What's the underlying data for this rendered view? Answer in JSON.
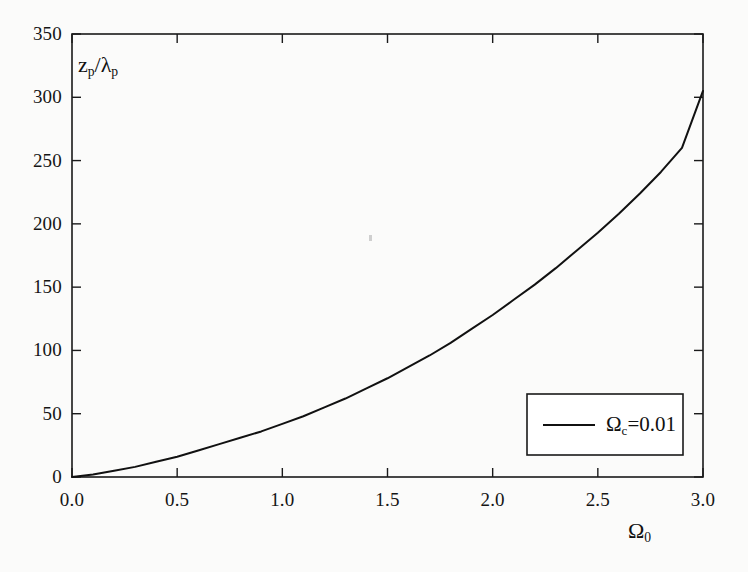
{
  "figure": {
    "background_color": "#fbfbfa",
    "line_color": "#111111",
    "frame_color": "#1a1a1a"
  },
  "axes": {
    "x_label": "Ω",
    "x_label_sub": "0",
    "y_label": "z",
    "y_label_sub": "p",
    "y_label_tail": "/λ",
    "y_label_tail_sub": "p"
  },
  "legend": {
    "entry_label": "Ω",
    "entry_label_sub": "c",
    "entry_label_tail": "=0.01"
  },
  "x_tick_labels": [
    "0.0",
    "0.5",
    "1.0",
    "1.5",
    "2.0",
    "2.5",
    "3.0"
  ],
  "y_tick_labels": [
    "0",
    "50",
    "100",
    "150",
    "200",
    "250",
    "300",
    "350"
  ],
  "chart_data": {
    "type": "line",
    "title": "",
    "xlabel": "Ω_0",
    "ylabel": "z_p/λ_p",
    "xlim": [
      0.0,
      3.0
    ],
    "ylim": [
      0,
      350
    ],
    "xticks": [
      0.0,
      0.5,
      1.0,
      1.5,
      2.0,
      2.5,
      3.0
    ],
    "yticks": [
      0,
      50,
      100,
      150,
      200,
      250,
      300,
      350
    ],
    "grid": false,
    "legend_position": "lower-right",
    "series": [
      {
        "name": "Ω_c=0.01",
        "color": "#111111",
        "x": [
          0.0,
          0.1,
          0.2,
          0.3,
          0.4,
          0.5,
          0.6,
          0.7,
          0.8,
          0.9,
          1.0,
          1.1,
          1.2,
          1.3,
          1.4,
          1.5,
          1.6,
          1.7,
          1.8,
          1.9,
          2.0,
          2.1,
          2.2,
          2.3,
          2.4,
          2.5,
          2.6,
          2.7,
          2.8,
          2.9,
          3.0
        ],
        "values": [
          0,
          2,
          5,
          8,
          12,
          16,
          21,
          26,
          31,
          36,
          42,
          48,
          55,
          62,
          70,
          78,
          87,
          96,
          106,
          117,
          128,
          140,
          152,
          165,
          179,
          193,
          208,
          224,
          241,
          260,
          305
        ]
      }
    ]
  }
}
